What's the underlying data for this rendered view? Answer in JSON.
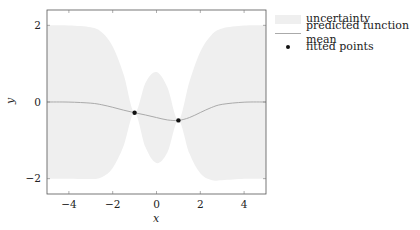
{
  "chart_data": {
    "type": "line",
    "title": "",
    "xlabel": "x",
    "ylabel": "y",
    "xlim": [
      -5,
      5
    ],
    "ylim": [
      -2.4,
      2.4
    ],
    "xticks": [
      -4,
      -2,
      0,
      2,
      4
    ],
    "xtick_labels": [
      "−4",
      "−2",
      "0",
      "2",
      "4"
    ],
    "yticks": [
      -2,
      0,
      2
    ],
    "ytick_labels": [
      "−2",
      "0",
      "2"
    ],
    "grid": false,
    "legend_position": "outside right, top",
    "x": [
      -5,
      -4,
      -3,
      -2.5,
      -2,
      -1.5,
      -1,
      -0.5,
      0,
      0.5,
      1,
      1.5,
      2,
      2.5,
      3,
      4,
      5
    ],
    "series": [
      {
        "name": "uncertainty",
        "kind": "band",
        "upper": [
          2.0,
          1.998,
          1.951,
          1.818,
          1.446,
          0.715,
          -0.28,
          0.505,
          0.78,
          0.376,
          -0.48,
          0.521,
          1.309,
          1.744,
          1.919,
          1.995,
          2.0
        ],
        "lower": [
          -2.0,
          -2.002,
          -2.01,
          -1.962,
          -1.722,
          -1.141,
          -0.28,
          -1.183,
          -1.592,
          -1.312,
          -0.48,
          -1.335,
          -1.859,
          -2.036,
          -2.041,
          -2.005,
          -2.0
        ],
        "color": "#efefef"
      },
      {
        "name": "predicted function mean",
        "kind": "line",
        "values": [
          0.0,
          -0.002,
          -0.03,
          -0.072,
          -0.138,
          -0.213,
          -0.28,
          -0.339,
          -0.406,
          -0.468,
          -0.48,
          -0.407,
          -0.275,
          -0.146,
          -0.061,
          -0.005,
          0.0
        ],
        "color": "#aaaaaa"
      },
      {
        "name": "fitted points",
        "kind": "scatter",
        "points": [
          [
            -1.0,
            -0.28
          ],
          [
            1.0,
            -0.48
          ]
        ],
        "color": "#111111"
      }
    ]
  },
  "legend": {
    "items": [
      {
        "label": "uncertainty"
      },
      {
        "label": "predicted function mean"
      },
      {
        "label": "fitted points"
      }
    ]
  }
}
